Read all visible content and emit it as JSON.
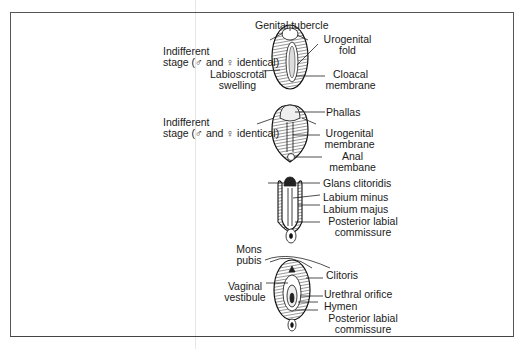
{
  "stages": [
    {
      "name": "indifferent-stage-1",
      "side_label_line1": "Indifferent",
      "side_label_line2": "stage (♂ and ♀ identical)",
      "labels": {
        "genital_tubercle": "Genital tubercle",
        "urogenital_fold_1": "Urogenital",
        "urogenital_fold_2": "fold",
        "labioscrotal_1": "Labioscrotal",
        "labioscrotal_2": "swelling",
        "cloacal_1": "Cloacal",
        "cloacal_2": "membrane"
      }
    },
    {
      "name": "indifferent-stage-2",
      "side_label_line1": "Indifferent",
      "side_label_line2": "stage (♂ and ♀ identical)",
      "labels": {
        "phallas": "Phallas",
        "urogenital_membrane_1": "Urogenital",
        "urogenital_membrane_2": "membrane",
        "anal_1": "Anal",
        "anal_2": "membane"
      }
    },
    {
      "name": "female-intermediate",
      "labels": {
        "glans": "Glans clitoridis",
        "labium_minus": "Labium minus",
        "labium_majus": "Labium majus",
        "posterior_1": "Posterior labial",
        "posterior_2": "commissure"
      }
    },
    {
      "name": "female-final",
      "labels": {
        "mons_1": "Mons",
        "mons_2": "pubis",
        "vestibule_1": "Vaginal",
        "vestibule_2": "vestibule",
        "clitoris": "Clitoris",
        "urethral": "Urethral orifice",
        "hymen": "Hymen",
        "posterior_1": "Posterior labial",
        "posterior_2": "commissure"
      }
    }
  ]
}
